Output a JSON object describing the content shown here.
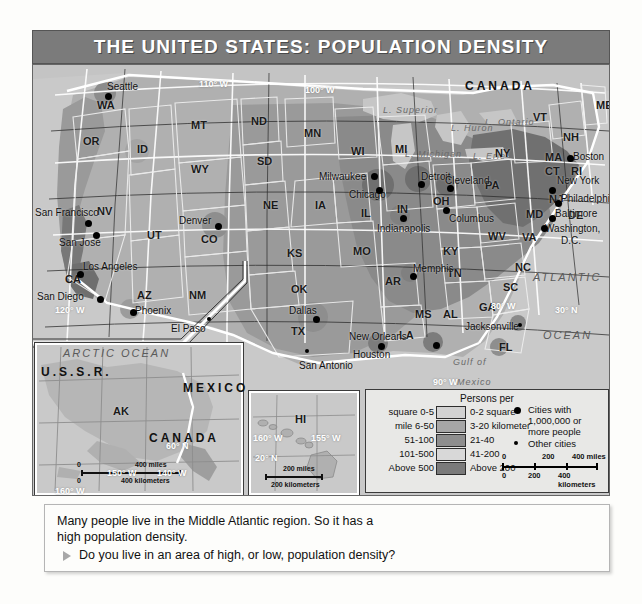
{
  "title": "THE UNITED STATES: POPULATION DENSITY",
  "map": {
    "countries": [
      {
        "name": "CANADA",
        "x": 432,
        "y": 14
      },
      {
        "name": "MEXICO",
        "x": 150,
        "y": 316
      },
      {
        "name": "U.S.S.R.",
        "x": 8,
        "y": 300
      },
      {
        "name": "CANADA",
        "x": 116,
        "y": 366
      }
    ],
    "oceans": [
      {
        "name": "ATLANTIC",
        "x": 500,
        "y": 206
      },
      {
        "name": "OCEAN",
        "x": 510,
        "y": 264
      },
      {
        "name": "Gulf of",
        "x": 420,
        "y": 292
      },
      {
        "name": "Mexico",
        "x": 424,
        "y": 312
      },
      {
        "name": "ARCTIC",
        "x": 30,
        "y": 282
      },
      {
        "name": "OCEAN",
        "x": 88,
        "y": 282
      },
      {
        "name": "L. Superior",
        "x": 350,
        "y": 40
      },
      {
        "name": "L. Michigan",
        "x": 372,
        "y": 84
      },
      {
        "name": "L. Huron",
        "x": 418,
        "y": 58
      },
      {
        "name": "L. Ontario",
        "x": 452,
        "y": 52
      },
      {
        "name": "L. Erie",
        "x": 440,
        "y": 86
      }
    ],
    "states": [
      {
        "ab": "WA",
        "x": 64,
        "y": 34
      },
      {
        "ab": "OR",
        "x": 50,
        "y": 70
      },
      {
        "ab": "ID",
        "x": 104,
        "y": 78
      },
      {
        "ab": "MT",
        "x": 158,
        "y": 54
      },
      {
        "ab": "ND",
        "x": 218,
        "y": 50
      },
      {
        "ab": "SD",
        "x": 224,
        "y": 90
      },
      {
        "ab": "MN",
        "x": 271,
        "y": 62
      },
      {
        "ab": "WI",
        "x": 318,
        "y": 80
      },
      {
        "ab": "MI",
        "x": 362,
        "y": 78
      },
      {
        "ab": "WY",
        "x": 158,
        "y": 98
      },
      {
        "ab": "NV",
        "x": 64,
        "y": 140
      },
      {
        "ab": "UT",
        "x": 114,
        "y": 164
      },
      {
        "ab": "CO",
        "x": 168,
        "y": 168
      },
      {
        "ab": "NE",
        "x": 230,
        "y": 134
      },
      {
        "ab": "IA",
        "x": 282,
        "y": 134
      },
      {
        "ab": "IL",
        "x": 328,
        "y": 142
      },
      {
        "ab": "IN",
        "x": 364,
        "y": 138
      },
      {
        "ab": "OH",
        "x": 400,
        "y": 130
      },
      {
        "ab": "PA",
        "x": 452,
        "y": 114
      },
      {
        "ab": "NY",
        "x": 462,
        "y": 82
      },
      {
        "ab": "VT",
        "x": 500,
        "y": 46
      },
      {
        "ab": "NH",
        "x": 530,
        "y": 66
      },
      {
        "ab": "ME",
        "x": 563,
        "y": 34
      },
      {
        "ab": "MA",
        "x": 512,
        "y": 86
      },
      {
        "ab": "CT",
        "x": 512,
        "y": 100
      },
      {
        "ab": "RI",
        "x": 538,
        "y": 100
      },
      {
        "ab": "NJ",
        "x": 516,
        "y": 128
      },
      {
        "ab": "DE",
        "x": 535,
        "y": 144
      },
      {
        "ab": "MD",
        "x": 493,
        "y": 143
      },
      {
        "ab": "WV",
        "x": 455,
        "y": 165
      },
      {
        "ab": "VA",
        "x": 489,
        "y": 166
      },
      {
        "ab": "KY",
        "x": 410,
        "y": 180
      },
      {
        "ab": "TN",
        "x": 414,
        "y": 202
      },
      {
        "ab": "NC",
        "x": 482,
        "y": 196
      },
      {
        "ab": "SC",
        "x": 470,
        "y": 216
      },
      {
        "ab": "GA",
        "x": 446,
        "y": 236
      },
      {
        "ab": "AL",
        "x": 410,
        "y": 243
      },
      {
        "ab": "MS",
        "x": 382,
        "y": 243
      },
      {
        "ab": "AR",
        "x": 352,
        "y": 210
      },
      {
        "ab": "LA",
        "x": 366,
        "y": 264
      },
      {
        "ab": "MO",
        "x": 320,
        "y": 180
      },
      {
        "ab": "KS",
        "x": 254,
        "y": 182
      },
      {
        "ab": "OK",
        "x": 258,
        "y": 218
      },
      {
        "ab": "TX",
        "x": 258,
        "y": 260
      },
      {
        "ab": "NM",
        "x": 156,
        "y": 224
      },
      {
        "ab": "AZ",
        "x": 104,
        "y": 224
      },
      {
        "ab": "CA",
        "x": 32,
        "y": 208
      },
      {
        "ab": "FL",
        "x": 466,
        "y": 276
      },
      {
        "ab": "AK",
        "x": 80,
        "y": 340
      },
      {
        "ab": "HI",
        "x": 262,
        "y": 348
      }
    ],
    "cities_major": [
      {
        "name": "Seattle",
        "lx": 74,
        "ly": 16,
        "dx": 72,
        "dy": 28
      },
      {
        "name": "San Francisco",
        "lx": 2,
        "ly": 142,
        "dx": 52,
        "dy": 155
      },
      {
        "name": "San Jose",
        "lx": 26,
        "ly": 172,
        "dx": 60,
        "dy": 167
      },
      {
        "name": "Los Angeles",
        "lx": 50,
        "ly": 196,
        "dx": 44,
        "dy": 206
      },
      {
        "name": "San Diego",
        "lx": 4,
        "ly": 226,
        "dx": 64,
        "dy": 231
      },
      {
        "name": "Phoenix",
        "lx": 102,
        "ly": 240,
        "dx": 97,
        "dy": 244
      },
      {
        "name": "Denver",
        "lx": 146,
        "ly": 150,
        "dx": 182,
        "dy": 158
      },
      {
        "name": "Dallas",
        "lx": 256,
        "ly": 240,
        "dx": 280,
        "dy": 251
      },
      {
        "name": "Houston",
        "lx": 320,
        "ly": 284,
        "dx": 345,
        "dy": 278
      },
      {
        "name": "New Orleans",
        "lx": 316,
        "ly": 266,
        "dx": 400,
        "dy": 277
      },
      {
        "name": "Milwaukee",
        "lx": 286,
        "ly": 106,
        "dx": 338,
        "dy": 108
      },
      {
        "name": "Chicago",
        "lx": 316,
        "ly": 124,
        "dx": 343,
        "dy": 122
      },
      {
        "name": "Detroit",
        "lx": 388,
        "ly": 106,
        "dx": 385,
        "dy": 116
      },
      {
        "name": "Cleveland",
        "lx": 412,
        "ly": 110,
        "dx": 414,
        "dy": 120
      },
      {
        "name": "Indianapolis",
        "lx": 344,
        "ly": 158,
        "dx": 367,
        "dy": 150
      },
      {
        "name": "Columbus",
        "lx": 416,
        "ly": 148,
        "dx": 410,
        "dy": 142
      },
      {
        "name": "Memphis",
        "lx": 380,
        "ly": 198,
        "dx": 377,
        "dy": 208
      },
      {
        "name": "Boston",
        "lx": 540,
        "ly": 86,
        "dx": 534,
        "dy": 90
      },
      {
        "name": "New York",
        "lx": 524,
        "ly": 110,
        "dx": 516,
        "dy": 122
      },
      {
        "name": "Philadelphia",
        "lx": 528,
        "ly": 128,
        "dx": 522,
        "dy": 135
      },
      {
        "name": "Baltimore",
        "lx": 522,
        "ly": 143,
        "dx": 516,
        "dy": 150
      },
      {
        "name": "Washington,",
        "lx": 512,
        "ly": 158,
        "dx": 508,
        "dy": 160
      },
      {
        "name": "D.C.",
        "lx": 528,
        "ly": 170,
        "dx": -99,
        "dy": -99
      }
    ],
    "cities_minor": [
      {
        "name": "El Paso",
        "lx": 138,
        "ly": 258,
        "dx": 174,
        "dy": 252
      },
      {
        "name": "San Antonio",
        "lx": 266,
        "ly": 295,
        "dx": 272,
        "dy": 284
      },
      {
        "name": "Jacksonville",
        "lx": 432,
        "ly": 256,
        "dx": 485,
        "dy": 258
      }
    ],
    "grid_labels": [
      {
        "t": "110° W",
        "x": 166,
        "y": 14,
        "w": true
      },
      {
        "t": "100° W",
        "x": 272,
        "y": 20,
        "w": true
      },
      {
        "t": "120° W",
        "x": 22,
        "y": 240,
        "w": true
      },
      {
        "t": "90° W",
        "x": 400,
        "y": 312,
        "w": true
      },
      {
        "t": "80° W",
        "x": 458,
        "y": 236,
        "w": true
      },
      {
        "t": "30° N",
        "x": 522,
        "y": 240,
        "w": true
      },
      {
        "t": "60° N",
        "x": 133,
        "y": 376,
        "w": true
      },
      {
        "t": "150° W",
        "x": 74,
        "y": 403,
        "w": true
      },
      {
        "t": "140° W",
        "x": 124,
        "y": 403,
        "w": true
      },
      {
        "t": "160° W",
        "x": 22,
        "y": 421,
        "w": true
      },
      {
        "t": "160° W",
        "x": 220,
        "y": 368,
        "w": true
      },
      {
        "t": "155° W",
        "x": 278,
        "y": 368,
        "w": true
      },
      {
        "t": "20° N",
        "x": 222,
        "y": 388,
        "w": true
      }
    ],
    "ak_scale": {
      "miles_zero": "0",
      "miles_val": "400",
      "miles_unit": "400 miles",
      "km_zero": "0",
      "km_unit": "400 kilometers"
    },
    "hi_scale": {
      "miles_unit": "200 miles",
      "km_unit": "200 kilometers"
    }
  },
  "legend": {
    "title": "Persons per",
    "rows": [
      {
        "left": "square 0-5",
        "right": "0-2 square",
        "color": "#d2d2d2"
      },
      {
        "left": "mile 6-50",
        "right": "3-20 kilometer",
        "color": "#a6a6a6"
      },
      {
        "left": "51-100",
        "right": "21-40",
        "color": "#8e8e8e"
      },
      {
        "left": "101-500",
        "right": "41-200",
        "color": "#d8d8d8"
      },
      {
        "left": "Above 500",
        "right": "Above 200",
        "color": "#7a7a7a"
      }
    ],
    "cities": [
      {
        "label1": "Cities with",
        "label2": "1,000,000 or",
        "label3": "more people",
        "size": "big"
      },
      {
        "label1": "Other cities",
        "label2": "",
        "label3": "",
        "size": "small"
      }
    ],
    "scale": {
      "miles_0": "0",
      "miles_200": "200",
      "miles_400": "400 miles",
      "km_0": "0",
      "km_200": "200",
      "km_400": "400 kilometers"
    }
  },
  "caption": {
    "line1": "Many people live in the Middle Atlantic region. So it has a",
    "line2": "high population density.",
    "question": "Do you live in an area of high, or low, population density?"
  },
  "colors": {
    "title_bar": "#7b7b7b",
    "map_bg": "#c9c9c9",
    "legend_bg": "#e8e8e6",
    "caption_bg": "#fdfdfb"
  }
}
